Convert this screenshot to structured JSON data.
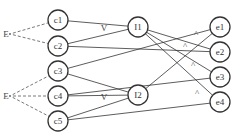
{
  "diagram": {
    "type": "network",
    "colors": {
      "stroke": "#333333",
      "dashed": "#555555",
      "background": "#ffffff"
    },
    "sources": [
      {
        "id": "E1",
        "label": "E",
        "x": 10,
        "y": 34
      },
      {
        "id": "E2",
        "label": "E",
        "x": 10,
        "y": 96
      }
    ],
    "input_nodes": [
      {
        "id": "c1",
        "label": "c1",
        "x": 58,
        "y": 20
      },
      {
        "id": "c2",
        "label": "c2",
        "x": 58,
        "y": 46
      },
      {
        "id": "c3",
        "label": "c3",
        "x": 58,
        "y": 71
      },
      {
        "id": "c4",
        "label": "c4",
        "x": 58,
        "y": 96
      },
      {
        "id": "c5",
        "label": "c5",
        "x": 58,
        "y": 121
      }
    ],
    "hidden_nodes": [
      {
        "id": "I1",
        "label": "I1",
        "x": 138,
        "y": 27
      },
      {
        "id": "I2",
        "label": "I2",
        "x": 138,
        "y": 95
      }
    ],
    "output_nodes": [
      {
        "id": "e1",
        "label": "e1",
        "x": 220,
        "y": 27
      },
      {
        "id": "e2",
        "label": "e2",
        "x": 220,
        "y": 52
      },
      {
        "id": "e3",
        "label": "e3",
        "x": 220,
        "y": 77
      },
      {
        "id": "e4",
        "label": "e4",
        "x": 220,
        "y": 102
      }
    ],
    "dashed_edges": [
      [
        "E1",
        "c1"
      ],
      [
        "E1",
        "c2"
      ],
      [
        "E2",
        "c3"
      ],
      [
        "E2",
        "c4"
      ],
      [
        "E2",
        "c5"
      ]
    ],
    "edges": [
      [
        "c1",
        "I1"
      ],
      [
        "c2",
        "I1"
      ],
      [
        "c2",
        "e2"
      ],
      [
        "c3",
        "e1"
      ],
      [
        "c3",
        "I2"
      ],
      [
        "c4",
        "I2"
      ],
      [
        "c4",
        "e3"
      ],
      [
        "c5",
        "I2"
      ],
      [
        "c5",
        "e4"
      ],
      [
        "I1",
        "e2"
      ],
      [
        "I1",
        "e3"
      ],
      [
        "I1",
        "e4"
      ],
      [
        "I2",
        "e1"
      ]
    ],
    "angle_markers": [
      {
        "at": "I1",
        "glyph": "V",
        "x": 104,
        "y": 31
      },
      {
        "at": "I2",
        "glyph": "V",
        "x": 104,
        "y": 100
      },
      {
        "at": "e1",
        "glyph": "^",
        "x": 196,
        "y": 37
      },
      {
        "at": "e2",
        "glyph": "^",
        "x": 185,
        "y": 49
      },
      {
        "at": "e3",
        "glyph": "^",
        "x": 193,
        "y": 68
      },
      {
        "at": "e4",
        "glyph": "^",
        "x": 197,
        "y": 96
      }
    ]
  }
}
